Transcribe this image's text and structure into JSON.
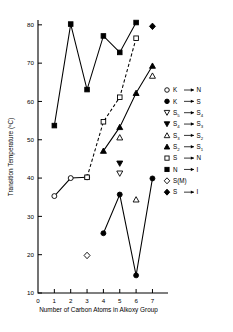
{
  "chart_data": {
    "type": "scatter",
    "title": "",
    "xlabel": "Number of Carbon Atoms in Alkoxy Group",
    "ylabel": "Transition Temperature (°C)",
    "xlim": [
      0,
      7.4
    ],
    "ylim": [
      10,
      81
    ],
    "xticks": [
      0,
      1,
      2,
      3,
      4,
      5,
      6,
      7
    ],
    "yticks": [
      10,
      20,
      30,
      40,
      50,
      60,
      70,
      80
    ],
    "xticklabels": [
      "0",
      "1",
      "2",
      "3",
      "4",
      "5",
      "6",
      "7"
    ],
    "yticklabels": [
      "10",
      "20",
      "30",
      "40",
      "50",
      "60",
      "70",
      "80"
    ],
    "grid": false,
    "legend_position": "right",
    "series": [
      {
        "name": "K → N",
        "marker": "open-circle",
        "connected": true,
        "linestyle": "solid",
        "x": [
          1,
          2,
          3
        ],
        "y": [
          35.3,
          40.0,
          40.2
        ]
      },
      {
        "name": "K → S",
        "marker": "filled-circle",
        "connected": true,
        "linestyle": "solid",
        "x": [
          4,
          5,
          6,
          7
        ],
        "y": [
          25.6,
          35.7,
          14.6,
          39.9
        ]
      },
      {
        "name": "S5 → S4",
        "marker": "open-down-triangle",
        "connected": false,
        "linestyle": "none",
        "x": [
          5
        ],
        "y": [
          41.2
        ]
      },
      {
        "name": "S4 → S3",
        "marker": "filled-down-triangle",
        "connected": false,
        "linestyle": "none",
        "x": [
          5
        ],
        "y": [
          43.8
        ]
      },
      {
        "name": "S3 → S2",
        "marker": "open-up-triangle",
        "connected": false,
        "linestyle": "none",
        "x": [
          5,
          6,
          7
        ],
        "y": [
          50.6,
          34.4,
          66.7
        ]
      },
      {
        "name": "S2 → S1",
        "marker": "filled-up-triangle",
        "connected": true,
        "linestyle": "solid",
        "x": [
          4,
          5,
          6,
          7
        ],
        "y": [
          47.1,
          53.3,
          62.2,
          69.3
        ]
      },
      {
        "name": "S → N",
        "marker": "open-square",
        "connected": true,
        "linestyle": "dashed",
        "x": [
          3,
          4,
          5,
          6
        ],
        "y": [
          40.2,
          54.7,
          61.1,
          76.5
        ]
      },
      {
        "name": "N → I",
        "marker": "filled-square",
        "connected": true,
        "linestyle": "solid",
        "x": [
          1,
          2,
          3,
          4,
          5,
          6
        ],
        "y": [
          53.7,
          80.2,
          63.1,
          77.1,
          72.8,
          80.6
        ]
      },
      {
        "name": "S(M)",
        "marker": "open-diamond",
        "connected": false,
        "linestyle": "none",
        "x": [
          3
        ],
        "y": [
          19.8
        ]
      },
      {
        "name": "S → I",
        "marker": "filled-diamond",
        "connected": false,
        "linestyle": "none",
        "x": [
          7
        ],
        "y": [
          79.6
        ]
      }
    ]
  },
  "legend": {
    "entries": [
      {
        "marker": "open-circle",
        "from": "K",
        "from_sub": "",
        "to": "N",
        "to_sub": "",
        "arrow": true
      },
      {
        "marker": "filled-circle",
        "from": "K",
        "from_sub": "",
        "to": "S",
        "to_sub": "",
        "arrow": true
      },
      {
        "marker": "open-down-triangle",
        "from": "S",
        "from_sub": "5",
        "to": "S",
        "to_sub": "4",
        "arrow": true
      },
      {
        "marker": "filled-down-triangle",
        "from": "S",
        "from_sub": "4",
        "to": "S",
        "to_sub": "3",
        "arrow": true
      },
      {
        "marker": "open-up-triangle",
        "from": "S",
        "from_sub": "3",
        "to": "S",
        "to_sub": "2",
        "arrow": true
      },
      {
        "marker": "filled-up-triangle",
        "from": "S",
        "from_sub": "2",
        "to": "S",
        "to_sub": "1",
        "arrow": true
      },
      {
        "marker": "open-square",
        "from": "S",
        "from_sub": "",
        "to": "N",
        "to_sub": "",
        "arrow": true
      },
      {
        "marker": "filled-square",
        "from": "N",
        "from_sub": "",
        "to": "I",
        "to_sub": "",
        "arrow": true
      },
      {
        "marker": "open-diamond",
        "from": "S(M)",
        "from_sub": "",
        "to": "",
        "to_sub": "",
        "arrow": false
      },
      {
        "marker": "filled-diamond",
        "from": "S",
        "from_sub": "",
        "to": "I",
        "to_sub": "",
        "arrow": true
      }
    ]
  },
  "colors": {
    "ink": "#000000",
    "background": "#ffffff"
  }
}
